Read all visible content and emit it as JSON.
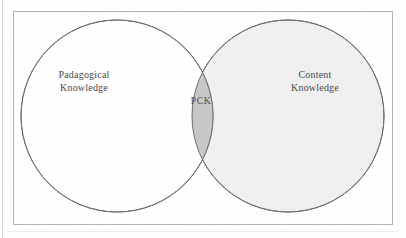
{
  "figure": {
    "type": "venn-diagram",
    "set_count": 2
  },
  "frame": {
    "border_color": "#b4b4b4",
    "background_color": "#ffffff"
  },
  "circles": {
    "left": {
      "label": "Padagogical\nKnowledge",
      "label_line_1": "Padagogical",
      "label_line_2": "Knowledge",
      "fill_color": "#ffffff",
      "stroke_color": "#6e6e6e"
    },
    "right": {
      "label": "Content\nKnowledge",
      "label_line_1": "Content",
      "label_line_2": "Knowledge",
      "fill_color": "#f0f0f0",
      "stroke_color": "#6e6e6e"
    }
  },
  "intersection": {
    "label": "PCK",
    "fill_color": "#c8c8c8",
    "meaning": "PCK"
  },
  "text_color": "#4a4a4a"
}
